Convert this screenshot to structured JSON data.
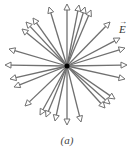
{
  "figure": {
    "caption": "(a)",
    "field_label": "E",
    "field_label_vector_mark": "→",
    "colors": {
      "arrow_stroke": "#707070",
      "arrowhead_fill": "#ffffff",
      "charge": "#000000",
      "background": "#ffffff"
    },
    "center": {
      "x": 67,
      "y": 66
    },
    "charge_radius": 2.5,
    "arrow_tips": [
      {
        "x": 49,
        "y": 7
      },
      {
        "x": 67,
        "y": 4
      },
      {
        "x": 79,
        "y": 5
      },
      {
        "x": 85,
        "y": 7
      },
      {
        "x": 91,
        "y": 10
      },
      {
        "x": 33,
        "y": 18
      },
      {
        "x": 26,
        "y": 22
      },
      {
        "x": 22,
        "y": 29
      },
      {
        "x": 9,
        "y": 49
      },
      {
        "x": 110,
        "y": 22
      },
      {
        "x": 120,
        "y": 38
      },
      {
        "x": 125,
        "y": 48
      },
      {
        "x": 5,
        "y": 65
      },
      {
        "x": 10,
        "y": 79
      },
      {
        "x": 14,
        "y": 87
      },
      {
        "x": 25,
        "y": 106
      },
      {
        "x": 127,
        "y": 65
      },
      {
        "x": 125,
        "y": 79
      },
      {
        "x": 115,
        "y": 99
      },
      {
        "x": 110,
        "y": 104
      },
      {
        "x": 105,
        "y": 108
      },
      {
        "x": 40,
        "y": 115
      },
      {
        "x": 46,
        "y": 117
      },
      {
        "x": 55,
        "y": 121
      },
      {
        "x": 67,
        "y": 125
      },
      {
        "x": 81,
        "y": 122
      }
    ]
  }
}
